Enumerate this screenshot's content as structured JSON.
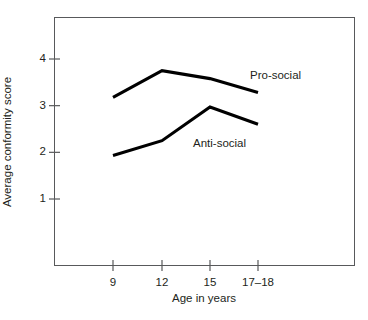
{
  "chart_data": {
    "type": "line",
    "title": "",
    "xlabel": "Age in years",
    "ylabel": "Average conformity score",
    "categories": [
      "9",
      "12",
      "15",
      "17–18"
    ],
    "x": [
      9,
      12,
      15,
      17.5
    ],
    "xtick_labels": [
      "9",
      "12",
      "15",
      "17–18"
    ],
    "ytick_labels": [
      "1",
      "2",
      "3",
      "4"
    ],
    "yticks": [
      1,
      2,
      3,
      4
    ],
    "ylim": [
      0.0,
      4.6
    ],
    "grid": false,
    "legend": "inline-labels",
    "line_color": "#000000",
    "axis_color": "#58595b",
    "series": [
      {
        "name": "Pro-social",
        "values": [
          3.18,
          3.75,
          3.58,
          3.28
        ]
      },
      {
        "name": "Anti-social",
        "values": [
          1.93,
          2.25,
          2.97,
          2.6
        ]
      }
    ]
  },
  "annotations": {
    "pro_social_label": "Pro-social",
    "anti_social_label": "Anti-social"
  }
}
